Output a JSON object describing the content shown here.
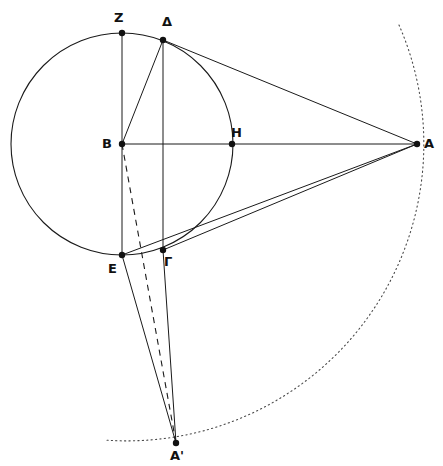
{
  "figure": {
    "width": 443,
    "height": 466,
    "background_color": "#ffffff",
    "stroke_color": "#1a1a1a",
    "dotted_arc_color": "#4a4a4a"
  },
  "points": {
    "Z": {
      "label": "Z",
      "x": 122,
      "y": 33,
      "label_x": 114,
      "label_y": 11
    },
    "D": {
      "label": "Δ",
      "x": 163,
      "y": 40,
      "label_x": 162,
      "label_y": 15
    },
    "B": {
      "label": "B",
      "x": 122,
      "y": 144,
      "label_x": 102,
      "label_y": 137
    },
    "H": {
      "label": "H",
      "x": 232,
      "y": 144,
      "label_x": 231,
      "label_y": 126
    },
    "A": {
      "label": "A",
      "x": 417,
      "y": 144,
      "label_x": 424,
      "label_y": 137
    },
    "E": {
      "label": "E",
      "x": 122,
      "y": 255,
      "label_x": 108,
      "label_y": 262
    },
    "G": {
      "label": "Γ",
      "x": 163,
      "y": 250,
      "label_x": 164,
      "label_y": 255
    },
    "Ap": {
      "label": "A'",
      "x": 176,
      "y": 443,
      "label_x": 170,
      "label_y": 449
    }
  },
  "circle": {
    "name": "main-circle",
    "center_x": 122,
    "center_y": 144,
    "radius": 111
  },
  "dotted_arc": {
    "name": "outer-dotted-arc",
    "center_x": 122,
    "center_y": 144,
    "radius": 297,
    "start_x": 399,
    "start_y": 25,
    "end_x": 104,
    "end_y": 440,
    "sweep": 1
  },
  "segments": [
    {
      "name": "segment-ZE-vertical",
      "from": "Z",
      "to": "E",
      "style": "solid"
    },
    {
      "name": "segment-DG-vertical",
      "from": "D",
      "to": "G",
      "style": "solid"
    },
    {
      "name": "segment-BA-horizontal",
      "from": "B",
      "to": "A",
      "style": "solid"
    },
    {
      "name": "segment-BD",
      "from": "B",
      "to": "D",
      "style": "solid"
    },
    {
      "name": "segment-DA",
      "from": "D",
      "to": "A",
      "style": "solid"
    },
    {
      "name": "segment-EA",
      "from": "E",
      "to": "A",
      "style": "solid"
    },
    {
      "name": "segment-GA",
      "from": "G",
      "to": "A",
      "style": "solid"
    },
    {
      "name": "segment-EAprime",
      "from": "E",
      "to": "Ap",
      "style": "solid"
    },
    {
      "name": "segment-GAprime",
      "from": "G",
      "to": "Ap",
      "style": "solid"
    },
    {
      "name": "segment-BAprime-dashed",
      "from": "B",
      "to": "Ap",
      "style": "dashed"
    }
  ],
  "chart_data": {
    "type": "scatter",
    "xlabel": "",
    "ylabel": "",
    "xlim": [
      0,
      443
    ],
    "ylim": [
      466,
      0
    ],
    "grid": false,
    "legend": "none",
    "labels": [
      "Z",
      "Δ",
      "B",
      "H",
      "A",
      "E",
      "Γ",
      "A'"
    ],
    "x": [
      122,
      163,
      122,
      232,
      417,
      122,
      163,
      176
    ],
    "y": [
      33,
      40,
      144,
      144,
      144,
      255,
      250,
      443
    ],
    "annotations": [
      "circle centered at B radius 111",
      "dotted arc centered at B radius 297 through A and A'",
      "vertical chord Z-B-E",
      "vertical chord Δ-Γ",
      "horizontal line B-H-A",
      "dashed line B to A'"
    ]
  }
}
